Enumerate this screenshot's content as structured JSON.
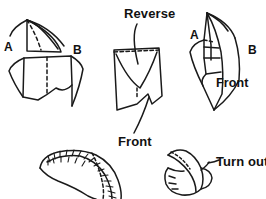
{
  "image": {
    "kind": "line-art-instructional-diagram",
    "subject": "sewing-collar-construction-steps",
    "width": 266,
    "height": 199,
    "background_color": "#ffffff",
    "ink_color": "#1a1a1a"
  },
  "labels": {
    "reverse": "Reverse",
    "front_middle": "Front",
    "front_right": "Front",
    "turn_out": "Turn out",
    "a_left": "A",
    "b_left": "B",
    "a_right": "A",
    "b_right": "B"
  },
  "figures": [
    {
      "id": "figure-top-left",
      "name": "flat-pattern-pieces-a-b",
      "labels": [
        "A",
        "B"
      ],
      "description": "Upper fan-shaped pattern piece with dashed fold line above a larger rectangular piece with dashed center line"
    },
    {
      "id": "figure-top-middle",
      "name": "folded-piece-reverse-front",
      "labels": [
        "Reverse",
        "Front"
      ],
      "description": "Rectangular folded piece with dashed horizontal line at top, V-shaped fold in center, leader lines to Reverse and Front labels"
    },
    {
      "id": "figure-top-right",
      "name": "assembled-piece-a-b-front",
      "labels": [
        "A",
        "B",
        "Front"
      ],
      "description": "Narrow tall folded assembly with curved outer edges, dashed detail, pointed bottom"
    },
    {
      "id": "figure-bottom-left",
      "name": "stitched-curved-tube",
      "labels": [],
      "description": "Curved tube shape with zigzag hand-stitch marks along the inner seam"
    },
    {
      "id": "figure-bottom-right",
      "name": "turning-out-tube",
      "labels": [
        "Turn out"
      ],
      "description": "Tube being turned inside out, dotted seam on the flap, leader line to Turn out label"
    }
  ]
}
